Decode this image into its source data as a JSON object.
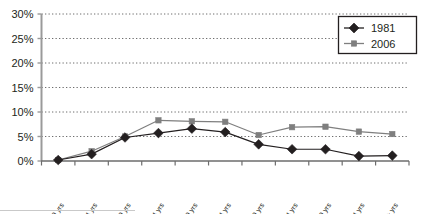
{
  "chart_data": {
    "type": "line",
    "title": "",
    "xlabel": "",
    "ylabel": "",
    "categories": [
      "15-19 yrs",
      "20-24 yrs",
      "25-29 yrs",
      "30-34 yrs",
      "35-39 yrs",
      "40-44 yrs",
      "45-49 yrs",
      "50-54 yrs",
      "55-59 yrs",
      "60-64 yrs",
      "65+ yrs"
    ],
    "series": [
      {
        "name": "1981",
        "color": "#231f20",
        "marker": "diamond",
        "values": [
          0.2,
          1.4,
          4.8,
          5.7,
          6.6,
          5.9,
          3.4,
          2.4,
          2.4,
          1.0,
          1.1
        ]
      },
      {
        "name": "2006",
        "color": "#7f7f7f",
        "marker": "square",
        "values": [
          0.2,
          2.0,
          5.0,
          8.3,
          8.1,
          8.0,
          5.3,
          6.9,
          7.0,
          6.0,
          5.5
        ]
      }
    ],
    "ylim": [
      0,
      30
    ],
    "ytick_values": [
      0,
      5,
      10,
      15,
      20,
      25,
      30
    ],
    "ytick_labels": [
      "0%",
      "5%",
      "10%",
      "15%",
      "20%",
      "25%",
      "30%"
    ],
    "grid": "horizontal-dotted",
    "legend_position": "top-right",
    "legend_entries": [
      "1981",
      "2006"
    ]
  },
  "axis_colors": {
    "axis_line": "#9a9a9a",
    "grid_line": "#6d6d6d",
    "text": "#231f20",
    "legend_border": "#231f20",
    "series_1981": "#231f20",
    "series_2006": "#7f7f7f"
  }
}
